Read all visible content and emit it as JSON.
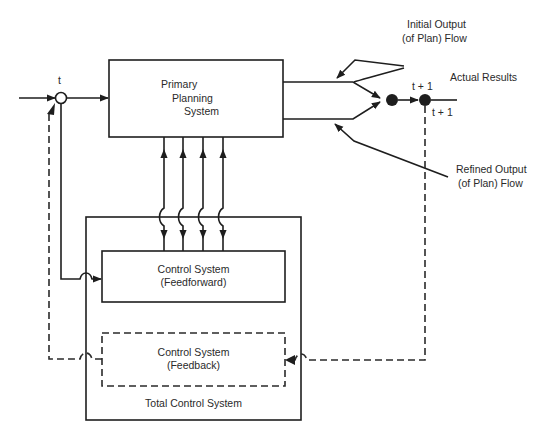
{
  "diagram": {
    "type": "block-diagram",
    "colors": {
      "line": "#1e1e1e",
      "text": "#2a2a2a",
      "background": "#ffffff"
    },
    "labels": {
      "time_t": "t",
      "time_t_plus_1_top": "t + 1",
      "time_t_plus_1_bottom": "t + 1",
      "actual_results": "Actual Results",
      "initial_output_line1": "Initial Output",
      "initial_output_line2": "(of Plan) Flow",
      "refined_output_line1": "Refined Output",
      "refined_output_line2": "(of Plan) Flow"
    },
    "boxes": {
      "primary_planning": {
        "line1": "Primary",
        "line2": "Planning",
        "line3": "System"
      },
      "feedforward": {
        "line1": "Control System",
        "line2": "(Feedforward)"
      },
      "feedback": {
        "line1": "Control System",
        "line2": "(Feedback)"
      },
      "total_control": {
        "label": "Total Control System"
      }
    },
    "connections": [
      {
        "from": "input",
        "to": "summing-junction-t",
        "style": "solid"
      },
      {
        "from": "summing-junction-t",
        "to": "primary_planning",
        "style": "solid"
      },
      {
        "from": "primary_planning",
        "to": "output-node",
        "label": "Initial Output (of Plan) Flow",
        "style": "solid"
      },
      {
        "from": "primary_planning",
        "to": "output-node",
        "label": "Refined Output (of Plan) Flow",
        "style": "solid"
      },
      {
        "from": "output-node",
        "to": "result-node-t+1",
        "style": "solid"
      },
      {
        "from": "result-node-t+1",
        "to": "Actual Results",
        "style": "solid"
      },
      {
        "from": "primary_planning",
        "to": "feedforward",
        "count": 4,
        "style": "solid",
        "bidirectional": true
      },
      {
        "from": "summing-junction-t",
        "to": "feedforward",
        "style": "solid"
      },
      {
        "from": "result-node-t+1",
        "to": "feedback",
        "style": "dashed"
      },
      {
        "from": "feedback",
        "to": "summing-junction-t",
        "style": "dashed"
      }
    ]
  }
}
